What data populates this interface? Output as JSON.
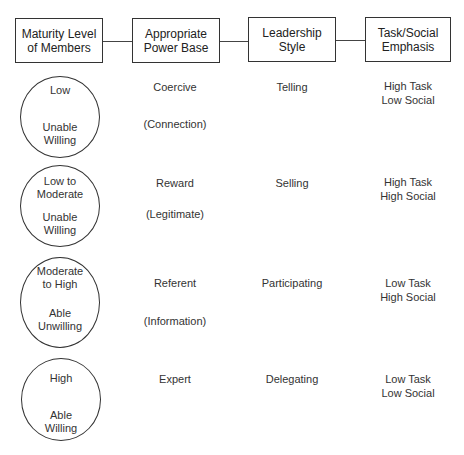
{
  "headers": [
    {
      "label": "Maturity Level\nof Members"
    },
    {
      "label": "Appropriate\nPower Base"
    },
    {
      "label": "Leadership\nStyle"
    },
    {
      "label": "Task/Social\nEmphasis"
    }
  ],
  "rows": [
    {
      "maturity_level": "Low",
      "maturity_traits": "Unable\nWilling",
      "power_base": "Coercive",
      "power_base_secondary": "(Connection)",
      "leadership_style": "Telling",
      "emphasis": "High Task\nLow Social"
    },
    {
      "maturity_level": "Low to\nModerate",
      "maturity_traits": "Unable\nWilling",
      "power_base": "Reward",
      "power_base_secondary": "(Legitimate)",
      "leadership_style": "Selling",
      "emphasis": "High Task\nHigh Social"
    },
    {
      "maturity_level": "Moderate\nto High",
      "maturity_traits": "Able\nUnwilling",
      "power_base": "Referent",
      "power_base_secondary": "(Information)",
      "leadership_style": "Participating",
      "emphasis": "Low Task\nHigh Social"
    },
    {
      "maturity_level": "High",
      "maturity_traits": "Able\nWilling",
      "power_base": "Expert",
      "power_base_secondary": "",
      "leadership_style": "Delegating",
      "emphasis": "Low Task\nLow Social"
    }
  ]
}
